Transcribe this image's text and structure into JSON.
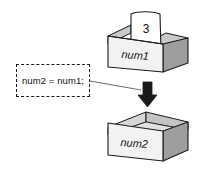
{
  "diagram": {
    "background_color": "#ffffff",
    "stroke_color": "#1a1a1a",
    "source_box": {
      "label": "num1",
      "contents_label": "3",
      "paper_icon": "paper-sheet-icon",
      "front_face_color": "#f2f2f2",
      "side_face_color": "#9e9e9e",
      "inner_face_color": "#c9c9c9"
    },
    "target_box": {
      "label": "num2",
      "contents_label": "",
      "front_face_color": "#f2f2f2",
      "side_face_color": "#9e9e9e",
      "inner_face_color": "#c9c9c9"
    },
    "annotation": {
      "code": "num2 = num1;",
      "border_style": "dashed",
      "border_color": "#1a1a1a",
      "connector_icon": "leader-line"
    },
    "arrow": {
      "icon": "arrow-down-icon",
      "direction": "down",
      "color": "#1a1a1a"
    }
  }
}
